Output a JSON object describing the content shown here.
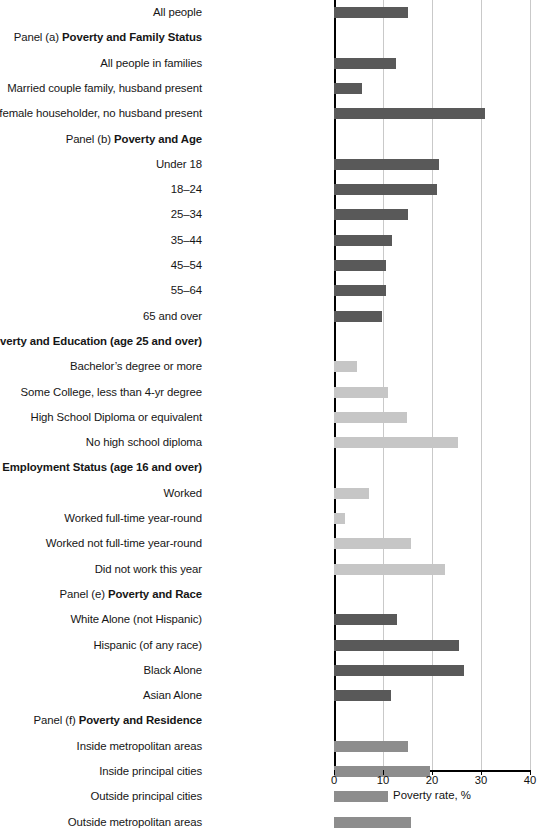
{
  "chart_data": {
    "type": "bar",
    "orientation": "horizontal",
    "title": "",
    "xlabel": "Poverty rate, %",
    "ylabel": "",
    "xlim": [
      0,
      40
    ],
    "xticks": [
      0,
      10,
      20,
      30,
      40
    ],
    "grid": true,
    "legend": "none",
    "rows": [
      {
        "kind": "bar",
        "label": "All people",
        "value": 15.1,
        "shade": "dark"
      },
      {
        "kind": "header",
        "panel": "Panel (a)",
        "title": "Poverty and Family Status"
      },
      {
        "kind": "bar",
        "label": "All people in families",
        "value": 12.7,
        "shade": "dark"
      },
      {
        "kind": "bar",
        "label": "Married couple family, husband present",
        "value": 5.8,
        "shade": "dark"
      },
      {
        "kind": "bar",
        "label": "Families with female householder, no husband present",
        "value": 30.9,
        "shade": "dark"
      },
      {
        "kind": "header",
        "panel": "Panel (b)",
        "title": "Poverty and Age"
      },
      {
        "kind": "bar",
        "label": "Under 18",
        "value": 21.5,
        "shade": "dark"
      },
      {
        "kind": "bar",
        "label": "18–24",
        "value": 21.0,
        "shade": "dark"
      },
      {
        "kind": "bar",
        "label": "25–34",
        "value": 15.1,
        "shade": "dark"
      },
      {
        "kind": "bar",
        "label": "35–44",
        "value": 11.8,
        "shade": "dark"
      },
      {
        "kind": "bar",
        "label": "45–54",
        "value": 10.7,
        "shade": "dark"
      },
      {
        "kind": "bar",
        "label": "55–64",
        "value": 10.7,
        "shade": "dark"
      },
      {
        "kind": "bar",
        "label": "65 and over",
        "value": 9.7,
        "shade": "dark"
      },
      {
        "kind": "header",
        "panel": "Panel (c)",
        "title": "Poverty and Education (age 25 and over)"
      },
      {
        "kind": "bar",
        "label": "Bachelor’s degree or more",
        "value": 4.6,
        "shade": "light"
      },
      {
        "kind": "bar",
        "label": "Some College, less than 4-yr degree",
        "value": 11.0,
        "shade": "light"
      },
      {
        "kind": "bar",
        "label": "High School Diploma or equivalent",
        "value": 14.9,
        "shade": "light"
      },
      {
        "kind": "bar",
        "label": "No high school diploma",
        "value": 25.3,
        "shade": "light"
      },
      {
        "kind": "header",
        "panel": "Panel (d)",
        "title": "Poverty and Employment Status (age 16 and over)"
      },
      {
        "kind": "bar",
        "label": "Worked",
        "value": 7.2,
        "shade": "light"
      },
      {
        "kind": "bar",
        "label": "Worked full-time year-round",
        "value": 2.3,
        "shade": "light"
      },
      {
        "kind": "bar",
        "label": "Worked not full-time year-round",
        "value": 15.8,
        "shade": "light"
      },
      {
        "kind": "bar",
        "label": "Did not work this year",
        "value": 22.7,
        "shade": "light"
      },
      {
        "kind": "header",
        "panel": "Panel (e)",
        "title": "Poverty and Race"
      },
      {
        "kind": "bar",
        "label": "White Alone (not Hispanic)",
        "value": 12.8,
        "shade": "dark"
      },
      {
        "kind": "bar",
        "label": "Hispanic (of any race)",
        "value": 25.6,
        "shade": "dark"
      },
      {
        "kind": "bar",
        "label": "Black Alone",
        "value": 26.5,
        "shade": "dark"
      },
      {
        "kind": "bar",
        "label": "Asian Alone",
        "value": 11.6,
        "shade": "dark"
      },
      {
        "kind": "header",
        "panel": "Panel (f)",
        "title": "Poverty and Residence"
      },
      {
        "kind": "bar",
        "label": "Inside metropolitan areas",
        "value": 15.0,
        "shade": "mid"
      },
      {
        "kind": "bar",
        "label": "Inside principal cities",
        "value": 19.5,
        "shade": "mid"
      },
      {
        "kind": "bar",
        "label": "Outside principal cities",
        "value": 11.1,
        "shade": "mid"
      },
      {
        "kind": "bar",
        "label": "Outside metropolitan areas",
        "value": 15.8,
        "shade": "mid"
      }
    ],
    "colors": {
      "dark": "#595959",
      "mid": "#8d8d8d",
      "light": "#c6c6c6",
      "gridline": "#c9c9c9",
      "axis": "#000000"
    }
  },
  "axis": {
    "title": "Poverty rate, %",
    "tick_labels": [
      "0",
      "10",
      "20",
      "30",
      "40"
    ]
  },
  "footnote": ""
}
